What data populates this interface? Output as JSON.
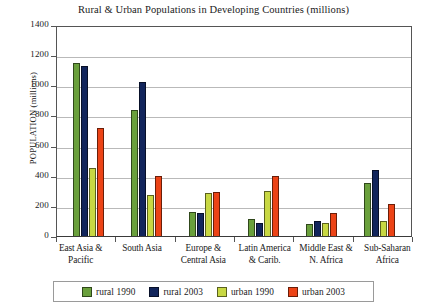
{
  "chart_data": {
    "type": "bar",
    "title": "Rural & Urban Populations in Developing Countries (millions)",
    "xlabel": "",
    "ylabel": "POPULATION (millions)",
    "ylim": [
      0,
      1400
    ],
    "ytick_step": 200,
    "yticks": [
      1400,
      1200,
      1000,
      800,
      600,
      400,
      200,
      0
    ],
    "grid": "horizontal",
    "legend_position": "bottom",
    "categories": [
      "East Asia & Pacific",
      "South Asia",
      "Europe & Central Asia",
      "Latin America & Carib.",
      "Middle East & N. Africa",
      "Sub-Saharan Africa"
    ],
    "category_lines": [
      [
        "East Asia &",
        "Pacific"
      ],
      [
        "South Asia",
        ""
      ],
      [
        "Europe &",
        "Central Asia"
      ],
      [
        "Latin America",
        "& Carib."
      ],
      [
        "Middle East &",
        "N. Africa"
      ],
      [
        "Sub-Saharan",
        "Africa"
      ]
    ],
    "series": [
      {
        "name": "rural 1990",
        "color": "#6aa03c",
        "values": [
          1145,
          835,
          160,
          110,
          80,
          355
        ]
      },
      {
        "name": "rural 2003",
        "color": "#12255c",
        "values": [
          1130,
          1020,
          150,
          85,
          100,
          440
        ]
      },
      {
        "name": "urban 1990",
        "color": "#c8d843",
        "values": [
          450,
          270,
          285,
          300,
          85,
          100
        ]
      },
      {
        "name": "urban 2003",
        "color": "#ec4316",
        "values": [
          720,
          400,
          295,
          400,
          155,
          215
        ]
      }
    ]
  },
  "legend": {
    "items": [
      {
        "label": "rural 1990",
        "color": "#6aa03c"
      },
      {
        "label": "rural 2003",
        "color": "#12255c"
      },
      {
        "label": "urban 1990",
        "color": "#c8d843"
      },
      {
        "label": "urban 2003",
        "color": "#ec4316"
      }
    ]
  }
}
